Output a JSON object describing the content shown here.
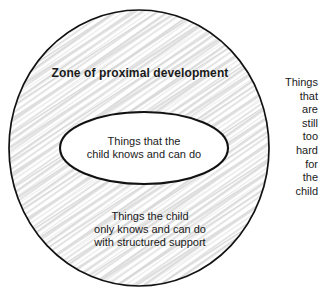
{
  "diagram": {
    "type": "concentric-circles-venn",
    "title": "Zone of proximal development",
    "background_color": "#ffffff",
    "stroke_color": "#111111",
    "hatch_color": "#d8d8d8",
    "outer_circle": {
      "label": "Zone of proximal development",
      "body_text": "Things the child\nonly knows and can do\nwith structured support",
      "fill": "hatched",
      "cx": 139,
      "cy": 148,
      "rx": 130,
      "ry": 138
    },
    "inner_ellipse": {
      "body_text": "Things that the\nchild knows and can do",
      "fill": "#ffffff",
      "cx": 144,
      "cy": 148,
      "rx": 84,
      "ry": 36
    },
    "outside_region": {
      "body_text": "Things\nthat\nare\nstill\ntoo\nhard\nfor\nthe\nchild",
      "fill": "#ffffff"
    }
  }
}
